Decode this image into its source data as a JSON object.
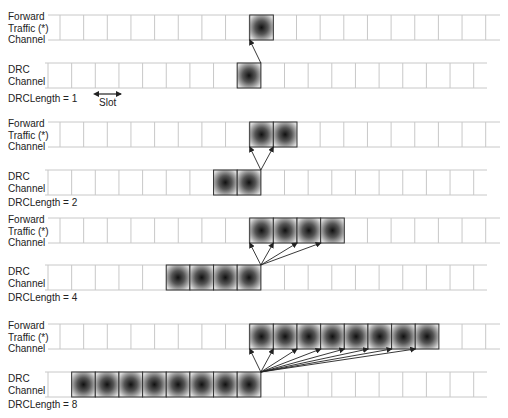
{
  "figure": {
    "slot_width": 23.65,
    "forward_row_x0": 60,
    "forward_row_x_end": 500,
    "forward_row_line_start": 48,
    "drc_row_x0": 48,
    "drc_row_x_end": 487,
    "drc_row_line_start": 45,
    "row_height": 25,
    "colors": {
      "grid": "#c8c8c8",
      "border": "#333333",
      "shade_outer": "#d8d8d8",
      "shade_inner": "#1a1a1a",
      "arrow": "#222222"
    },
    "slot_annotation": {
      "label": "Slot",
      "x1": 98,
      "x2": 121,
      "y": 94,
      "text_x": 99,
      "text_y": 98
    },
    "sections": [
      {
        "forward_label": "Forward\nTraffic (*)\nChannel",
        "drc_label": "DRC\nChannel",
        "length_label": "DRCLength = 1",
        "drc_length": 1,
        "forward_y": 15,
        "drc_y": 63,
        "length_y": 80,
        "drc_shaded_start_slot": 8,
        "forward_shaded_start_slot": 9
      },
      {
        "forward_label": "Forward\nTraffic (*)\nChannel",
        "drc_label": "DRC\nChannel",
        "length_label": "DRCLength = 2",
        "drc_length": 2,
        "forward_y": 122,
        "drc_y": 170,
        "length_y": 196,
        "drc_shaded_start_slot": 7,
        "forward_shaded_start_slot": 9
      },
      {
        "forward_label": "Forward\nTraffic (*)\nChannel",
        "drc_label": "DRC\nChannel",
        "length_label": "DRCLength = 4",
        "drc_length": 4,
        "forward_y": 218,
        "drc_y": 265,
        "length_y": 291,
        "drc_shaded_start_slot": 5,
        "forward_shaded_start_slot": 9
      },
      {
        "forward_label": "Forward\nTraffic (*)\nChannel",
        "drc_label": "DRC\nChannel",
        "length_label": "DRCLength = 8",
        "drc_length": 8,
        "forward_y": 324,
        "drc_y": 372,
        "length_y": 398,
        "drc_shaded_start_slot": 1,
        "forward_shaded_start_slot": 9
      }
    ]
  }
}
